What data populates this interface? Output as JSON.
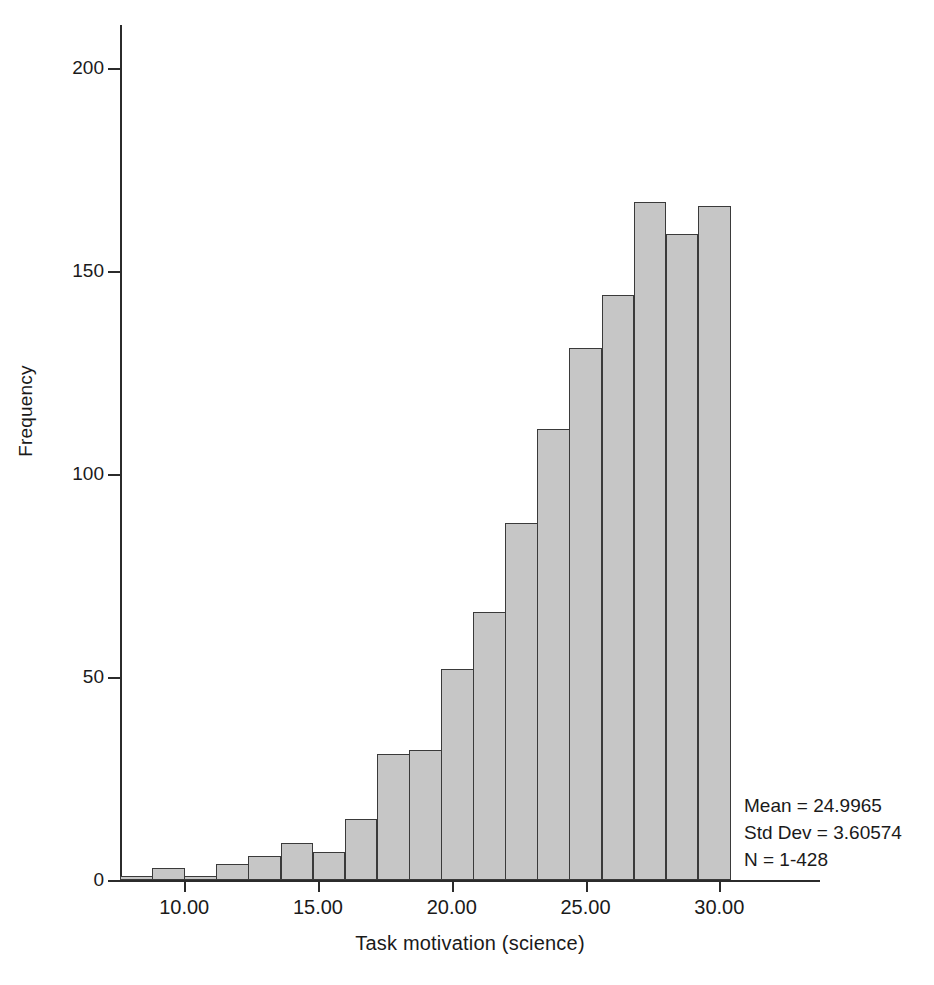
{
  "chart_data": {
    "type": "bar",
    "title": "",
    "subtitle": "",
    "xlabel": "Task motivation (science)",
    "ylabel": "Frequency",
    "xlim": [
      7.6,
      30.6
    ],
    "ylim": [
      0,
      215
    ],
    "grid": false,
    "legend": null,
    "bin_width": 1.2,
    "x_tick_labels": [
      "10.00",
      "15.00",
      "20.00",
      "25.00",
      "30.00"
    ],
    "x_tick_values": [
      10,
      15,
      20,
      25,
      30
    ],
    "y_tick_labels": [
      "0",
      "50",
      "100",
      "150",
      "200"
    ],
    "y_tick_values": [
      0,
      50,
      100,
      150,
      200
    ],
    "bin_centers": [
      8.2,
      9.4,
      10.6,
      11.8,
      13.0,
      14.2,
      15.4,
      16.6,
      17.8,
      19.0,
      20.2,
      21.4,
      22.6,
      23.8,
      25.0,
      26.2,
      27.4,
      28.6,
      29.8
    ],
    "bin_starts": [
      7.6,
      8.8,
      10.0,
      11.2,
      12.4,
      13.6,
      14.8,
      16.0,
      17.2,
      18.4,
      19.6,
      20.8,
      22.0,
      23.2,
      24.4,
      25.6,
      26.8,
      28.0,
      29.2
    ],
    "values": [
      1,
      3,
      1,
      4,
      6,
      9,
      7,
      15,
      31,
      32,
      52,
      66,
      88,
      111,
      131,
      144,
      167,
      159,
      166,
      126,
      107
    ],
    "bars": [
      {
        "start": 7.6,
        "end": 8.8,
        "value": 1
      },
      {
        "start": 8.8,
        "end": 10.0,
        "value": 3
      },
      {
        "start": 10.0,
        "end": 11.2,
        "value": 1
      },
      {
        "start": 11.2,
        "end": 12.4,
        "value": 4
      },
      {
        "start": 12.4,
        "end": 13.6,
        "value": 6
      },
      {
        "start": 13.6,
        "end": 14.8,
        "value": 9
      },
      {
        "start": 14.8,
        "end": 16.0,
        "value": 7
      },
      {
        "start": 16.0,
        "end": 17.2,
        "value": 15
      },
      {
        "start": 17.2,
        "end": 18.4,
        "value": 31
      },
      {
        "start": 18.4,
        "end": 19.6,
        "value": 32
      },
      {
        "start": 19.6,
        "end": 20.8,
        "value": 52
      },
      {
        "start": 20.8,
        "end": 22.0,
        "value": 66
      },
      {
        "start": 22.0,
        "end": 23.2,
        "value": 88
      },
      {
        "start": 23.2,
        "end": 24.4,
        "value": 111
      },
      {
        "start": 24.4,
        "end": 25.6,
        "value": 131
      },
      {
        "start": 25.6,
        "end": 26.8,
        "value": 144
      },
      {
        "start": 26.8,
        "end": 28.0,
        "value": 167
      },
      {
        "start": 28.0,
        "end": 29.2,
        "value": 159
      },
      {
        "start": 29.2,
        "end": 30.4,
        "value": 166
      },
      {
        "start": 30.4,
        "end": 31.6,
        "value": 126
      },
      {
        "start": 31.6,
        "end": 32.8,
        "value": 107
      }
    ],
    "annotations": {
      "mean_line": "Mean = 24.9965",
      "std_dev_line": "Std Dev = 3.60574",
      "n_line": "N = 1-428"
    },
    "colors": {
      "bar_fill": "#c6c6c6",
      "bar_border": "#3a3a3a",
      "axis": "#2b2b2b",
      "text": "#1a1a1a",
      "background": "#ffffff"
    }
  },
  "stats": {
    "mean": "Mean = 24.9965",
    "std_dev": "Std Dev = 3.60574",
    "n": "N = 1-428"
  },
  "axes": {
    "y_title": "Frequency",
    "x_title": "Task motivation (science)"
  }
}
